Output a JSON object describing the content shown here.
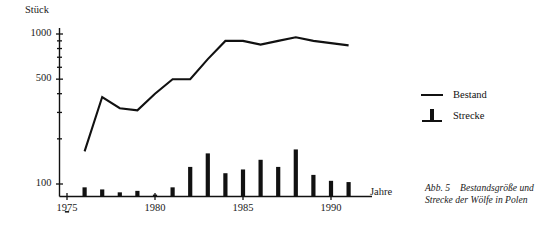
{
  "chart_data": {
    "type": "line",
    "title": "",
    "xlabel": "Jahre",
    "ylabel": "Stück",
    "yscale": "log",
    "ylim": [
      60,
      1200
    ],
    "xlim": [
      1974.2,
      1991.8
    ],
    "grid": false,
    "legend_position": "right",
    "ytick_labels": [
      "1000",
      "500",
      "100"
    ],
    "ytick_values": [
      1000,
      500,
      100
    ],
    "yminor_ticks": [
      900,
      800,
      700,
      600,
      400,
      300,
      200
    ],
    "xtick_labels": [
      "1975",
      "1980",
      "1985",
      "1990"
    ],
    "xtick_values": [
      1975,
      1980,
      1985,
      1990
    ],
    "series": [
      {
        "name": "Bestand",
        "style": "line",
        "x": [
          1976,
          1977,
          1978,
          1979,
          1980,
          1981,
          1982,
          1983,
          1984,
          1985,
          1986,
          1987,
          1988,
          1989,
          1990,
          1991
        ],
        "values": [
          165,
          380,
          320,
          310,
          400,
          500,
          500,
          680,
          900,
          900,
          850,
          900,
          950,
          900,
          870,
          840
        ]
      },
      {
        "name": "Strecke",
        "style": "bar",
        "x": [
          1975,
          1976,
          1977,
          1978,
          1979,
          1980,
          1981,
          1982,
          1983,
          1984,
          1985,
          1986,
          1987,
          1988,
          1989,
          1990,
          1991
        ],
        "values": [
          66,
          95,
          92,
          88,
          90,
          85,
          95,
          130,
          160,
          118,
          125,
          145,
          130,
          170,
          115,
          105,
          103
        ]
      }
    ]
  },
  "legend": {
    "items": [
      {
        "label": "Bestand",
        "key": "line-key"
      },
      {
        "label": "Strecke",
        "key": "bar-key"
      }
    ]
  },
  "caption": {
    "number": "Abb. 5",
    "text": "Bestandsgröße und Strecke der Wölfe in Polen"
  }
}
